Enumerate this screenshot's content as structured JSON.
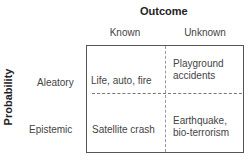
{
  "title": "Outcome",
  "y_axis_label": "Probability",
  "columns": [
    "Known",
    "Unknown"
  ],
  "rows": [
    "Aleatory",
    "Epistemic"
  ],
  "cells": {
    "aleatory_known": "Life, auto, fire",
    "aleatory_unknown_1": "Playground",
    "aleatory_unknown_2": "accidents",
    "epistemic_known": "Satellite crash",
    "epistemic_unknown_1": "Earthquake,",
    "epistemic_unknown_2": "bio-terrorism"
  }
}
